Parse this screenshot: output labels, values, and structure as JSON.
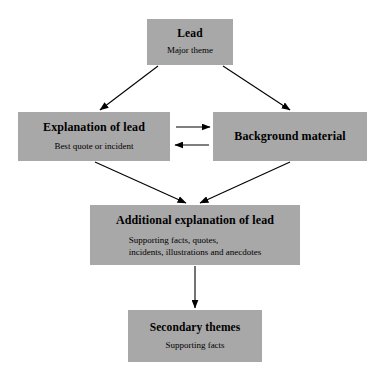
{
  "diagram": {
    "title_text": "News story structure flowchart",
    "box_fill_color": "#a8a8a8",
    "text_color": "#000000",
    "background_color": "#ffffff",
    "arrow_color": "#000000",
    "nodes": [
      {
        "id": "lead",
        "title": "Lead",
        "subtitle": "Major theme"
      },
      {
        "id": "explanation",
        "title": "Explanation of lead",
        "subtitle": "Best quote or incident"
      },
      {
        "id": "background",
        "title": "Background material",
        "subtitle": ""
      },
      {
        "id": "additional",
        "title": "Additional explanation of lead",
        "subtitle_line_1": "Supporting facts, quotes,",
        "subtitle_line_2": "incidents, illustrations and anecdotes"
      },
      {
        "id": "secondary",
        "title": "Secondary themes",
        "subtitle": "Supporting facts"
      }
    ],
    "edges": [
      {
        "id": "lead-to-explanation",
        "from": "lead",
        "to": "explanation",
        "style": "single-arrow-diagonal"
      },
      {
        "id": "lead-to-background",
        "from": "lead",
        "to": "background",
        "style": "single-arrow-diagonal"
      },
      {
        "id": "explanation-to-background",
        "from": "explanation",
        "to": "background",
        "style": "single-arrow-horizontal"
      },
      {
        "id": "background-to-explanation",
        "from": "background",
        "to": "explanation",
        "style": "single-arrow-horizontal"
      },
      {
        "id": "explanation-to-additional",
        "from": "explanation",
        "to": "additional",
        "style": "single-arrow-diagonal"
      },
      {
        "id": "background-to-additional",
        "from": "background",
        "to": "additional",
        "style": "single-arrow-diagonal"
      },
      {
        "id": "additional-to-secondary",
        "from": "additional",
        "to": "secondary",
        "style": "single-arrow-vertical"
      }
    ]
  }
}
